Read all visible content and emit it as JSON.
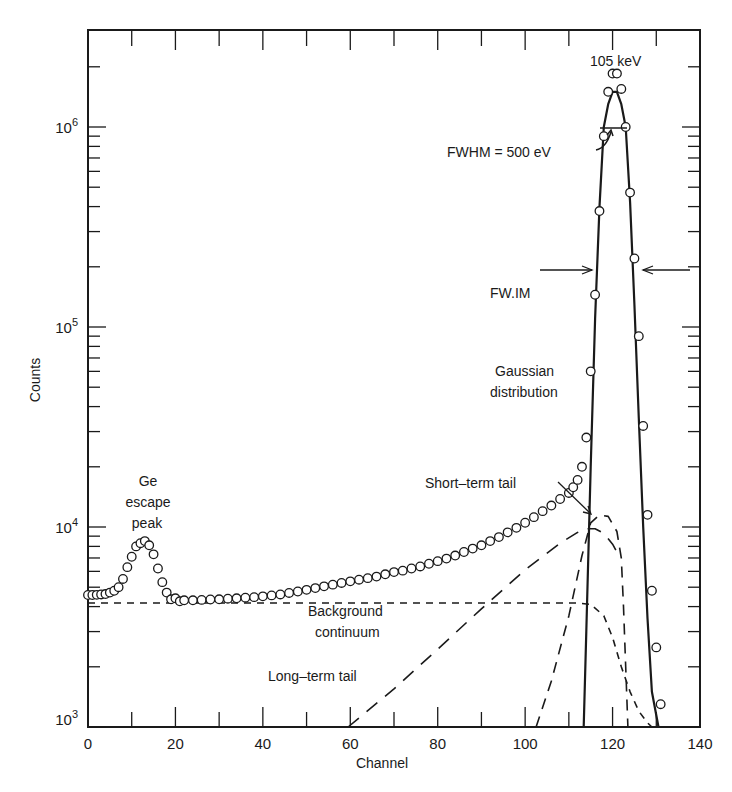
{
  "chart_data": {
    "type": "scatter",
    "title": "",
    "xlabel": "Channel",
    "ylabel": "Counts",
    "xlim": [
      0,
      140
    ],
    "ylim": [
      1000,
      2500000
    ],
    "yscale": "log",
    "grid": false,
    "x_ticks": [
      0,
      20,
      40,
      60,
      80,
      100,
      120,
      140
    ],
    "y_ticks": [
      {
        "value": 1000,
        "label_base": "10",
        "label_exp": "3"
      },
      {
        "value": 10000,
        "label_base": "10",
        "label_exp": "4"
      },
      {
        "value": 100000,
        "label_base": "10",
        "label_exp": "5"
      },
      {
        "value": 1000000,
        "label_base": "10",
        "label_exp": "6"
      }
    ],
    "series": [
      {
        "name": "Measured spectrum",
        "style": "open-circles",
        "points": [
          [
            0,
            4570
          ],
          [
            1,
            4570
          ],
          [
            2,
            4580
          ],
          [
            3,
            4600
          ],
          [
            4,
            4620
          ],
          [
            5,
            4700
          ],
          [
            6,
            4800
          ],
          [
            7,
            5000
          ],
          [
            8,
            5500
          ],
          [
            9,
            6300
          ],
          [
            10,
            7100
          ],
          [
            11,
            8000
          ],
          [
            12,
            8300
          ],
          [
            13,
            8500
          ],
          [
            14,
            8100
          ],
          [
            15,
            7300
          ],
          [
            16,
            6200
          ],
          [
            17,
            5300
          ],
          [
            18,
            4700
          ],
          [
            19,
            4350
          ],
          [
            20,
            4400
          ],
          [
            21,
            4250
          ],
          [
            22,
            4300
          ],
          [
            24,
            4300
          ],
          [
            26,
            4320
          ],
          [
            28,
            4340
          ],
          [
            30,
            4350
          ],
          [
            32,
            4380
          ],
          [
            34,
            4400
          ],
          [
            36,
            4430
          ],
          [
            38,
            4460
          ],
          [
            40,
            4500
          ],
          [
            42,
            4550
          ],
          [
            44,
            4600
          ],
          [
            46,
            4680
          ],
          [
            48,
            4760
          ],
          [
            50,
            4850
          ],
          [
            52,
            4950
          ],
          [
            54,
            5050
          ],
          [
            56,
            5150
          ],
          [
            58,
            5250
          ],
          [
            60,
            5350
          ],
          [
            62,
            5450
          ],
          [
            64,
            5550
          ],
          [
            66,
            5650
          ],
          [
            68,
            5800
          ],
          [
            70,
            5950
          ],
          [
            72,
            6050
          ],
          [
            74,
            6200
          ],
          [
            76,
            6350
          ],
          [
            78,
            6550
          ],
          [
            80,
            6750
          ],
          [
            82,
            6950
          ],
          [
            84,
            7200
          ],
          [
            86,
            7500
          ],
          [
            88,
            7800
          ],
          [
            90,
            8100
          ],
          [
            92,
            8500
          ],
          [
            94,
            8900
          ],
          [
            96,
            9400
          ],
          [
            98,
            9900
          ],
          [
            100,
            10500
          ],
          [
            102,
            11200
          ],
          [
            104,
            12000
          ],
          [
            106,
            12800
          ],
          [
            108,
            13800
          ],
          [
            110,
            14800
          ],
          [
            111,
            15800
          ],
          [
            112,
            17200
          ],
          [
            113,
            20000
          ],
          [
            114,
            28000
          ],
          [
            115,
            60000
          ],
          [
            116,
            145000
          ],
          [
            117,
            380000
          ],
          [
            118,
            900000
          ],
          [
            119,
            1500000
          ],
          [
            120,
            1850000
          ],
          [
            121,
            1850000
          ],
          [
            122,
            1550000
          ],
          [
            123,
            1000000
          ],
          [
            124,
            470000
          ],
          [
            125,
            220000
          ],
          [
            126,
            90000
          ],
          [
            127,
            32000
          ],
          [
            128,
            11500
          ],
          [
            129,
            4800
          ],
          [
            130,
            2500
          ],
          [
            131,
            1300
          ]
        ]
      },
      {
        "name": "Gaussian distribution",
        "style": "solid",
        "points": [
          [
            113.4,
            1000
          ],
          [
            114,
            3000
          ],
          [
            115,
            20000
          ],
          [
            116,
            110000
          ],
          [
            117,
            400000
          ],
          [
            118,
            1000000
          ],
          [
            119,
            1300000
          ],
          [
            120,
            1500000
          ],
          [
            121,
            1500000
          ],
          [
            122,
            1300000
          ],
          [
            123,
            1000000
          ],
          [
            124,
            420000
          ],
          [
            125,
            130000
          ],
          [
            126,
            35000
          ],
          [
            127,
            10000
          ],
          [
            128,
            3500
          ],
          [
            129,
            1500
          ],
          [
            130.5,
            1000
          ]
        ]
      },
      {
        "name": "Background continuum",
        "style": "dashed",
        "points": [
          [
            0,
            4170
          ],
          [
            20,
            4170
          ],
          [
            40,
            4170
          ],
          [
            60,
            4170
          ],
          [
            80,
            4170
          ],
          [
            100,
            4170
          ],
          [
            112,
            4170
          ],
          [
            115,
            4100
          ],
          [
            118,
            3600
          ],
          [
            120,
            2800
          ],
          [
            122,
            2000
          ],
          [
            124,
            1500
          ],
          [
            126,
            1200
          ],
          [
            128,
            1050
          ],
          [
            129,
            1000
          ]
        ]
      },
      {
        "name": "Long-term tail",
        "style": "dashed",
        "points": [
          [
            59.5,
            1000
          ],
          [
            70,
            1550
          ],
          [
            80,
            2450
          ],
          [
            90,
            3900
          ],
          [
            100,
            6100
          ],
          [
            108,
            8300
          ],
          [
            112,
            9400
          ],
          [
            114,
            9800
          ],
          [
            116,
            9800
          ],
          [
            118,
            9300
          ],
          [
            120,
            8200
          ],
          [
            121,
            7500
          ],
          [
            121.5,
            6900
          ]
        ]
      },
      {
        "name": "Short-term tail",
        "style": "dashed",
        "points": [
          [
            102.5,
            1000
          ],
          [
            106,
            1700
          ],
          [
            110,
            3600
          ],
          [
            113,
            7200
          ],
          [
            115,
            10500
          ],
          [
            117,
            11500
          ],
          [
            119,
            11300
          ],
          [
            121,
            9500
          ],
          [
            122,
            7000
          ],
          [
            122.5,
            4000
          ],
          [
            123,
            2000
          ],
          [
            123.5,
            1000
          ]
        ]
      }
    ],
    "annotations": [
      {
        "text": "105 keV",
        "channel": 120,
        "counts": 2300000
      },
      {
        "text": "FWHM = 500 eV",
        "arrow_to": [
          118.5,
          900000
        ]
      },
      {
        "text": "FW.IM",
        "marker": "horizontal arrows at ~200000 counts between the peak flanks"
      },
      {
        "text": "Gaussian distribution"
      },
      {
        "text": "Ge escape peak"
      },
      {
        "text": "Short-term tail",
        "arrow_to": [
          117,
          11500
        ]
      },
      {
        "text": "Background continuum"
      },
      {
        "text": "Long-term tail"
      }
    ]
  },
  "labels": {
    "x_axis": "Channel",
    "y_axis": "Counts",
    "peak_energy": "105 keV",
    "fwhm": "FWHM = 500 eV",
    "fwim": "FW.IM",
    "gaussian_1": "Gaussian",
    "gaussian_2": "distribution",
    "escape_1": "Ge",
    "escape_2": "escape",
    "escape_3": "peak",
    "short_tail": "Short–term tail",
    "background_1": "Background",
    "background_2": "continuum",
    "long_tail": "Long–term tail"
  },
  "colors": {
    "ink": "#1a1a1a",
    "background": "#ffffff"
  }
}
